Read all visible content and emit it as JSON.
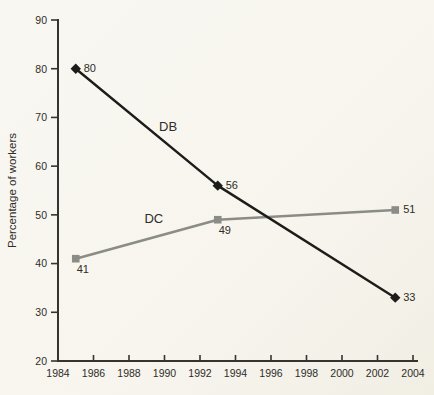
{
  "chart_data": {
    "type": "line",
    "title": "",
    "xlabel": "",
    "ylabel": "Percentage of workers",
    "xlim": [
      1984,
      2004
    ],
    "ylim": [
      20,
      90
    ],
    "x_ticks": [
      "1984",
      "1986",
      "1988",
      "1990",
      "1992",
      "1994",
      "1996",
      "1998",
      "2000",
      "2002",
      "2004"
    ],
    "x_tick_values": [
      1984,
      1986,
      1988,
      1990,
      1992,
      1994,
      1996,
      1998,
      2000,
      2002,
      2004
    ],
    "y_ticks": [
      "20",
      "30",
      "40",
      "50",
      "60",
      "70",
      "80",
      "90"
    ],
    "y_tick_values": [
      20,
      30,
      40,
      50,
      60,
      70,
      80,
      90
    ],
    "grid": false,
    "legend_position": "inline-labels",
    "axis_color": "#35342f",
    "text_color": "#2e2d29",
    "series": [
      {
        "name": "DC",
        "color": "#8c8c87",
        "marker": "square",
        "x": [
          1985,
          1993,
          2003
        ],
        "values": [
          41,
          49,
          51
        ],
        "point_labels": [
          "41",
          "49",
          "51"
        ],
        "label_sides": [
          "below",
          "below",
          "right"
        ],
        "label_pos": {
          "x": 1989.4,
          "y": 48.3
        }
      },
      {
        "name": "DB",
        "color": "#1d1c1a",
        "marker": "diamond",
        "x": [
          1985,
          1993,
          2003
        ],
        "values": [
          80,
          56,
          33
        ],
        "point_labels": [
          "80",
          "56",
          "33"
        ],
        "label_sides": [
          "right",
          "right",
          "right"
        ],
        "label_pos": {
          "x": 1990.2,
          "y": 67.2
        }
      }
    ]
  }
}
